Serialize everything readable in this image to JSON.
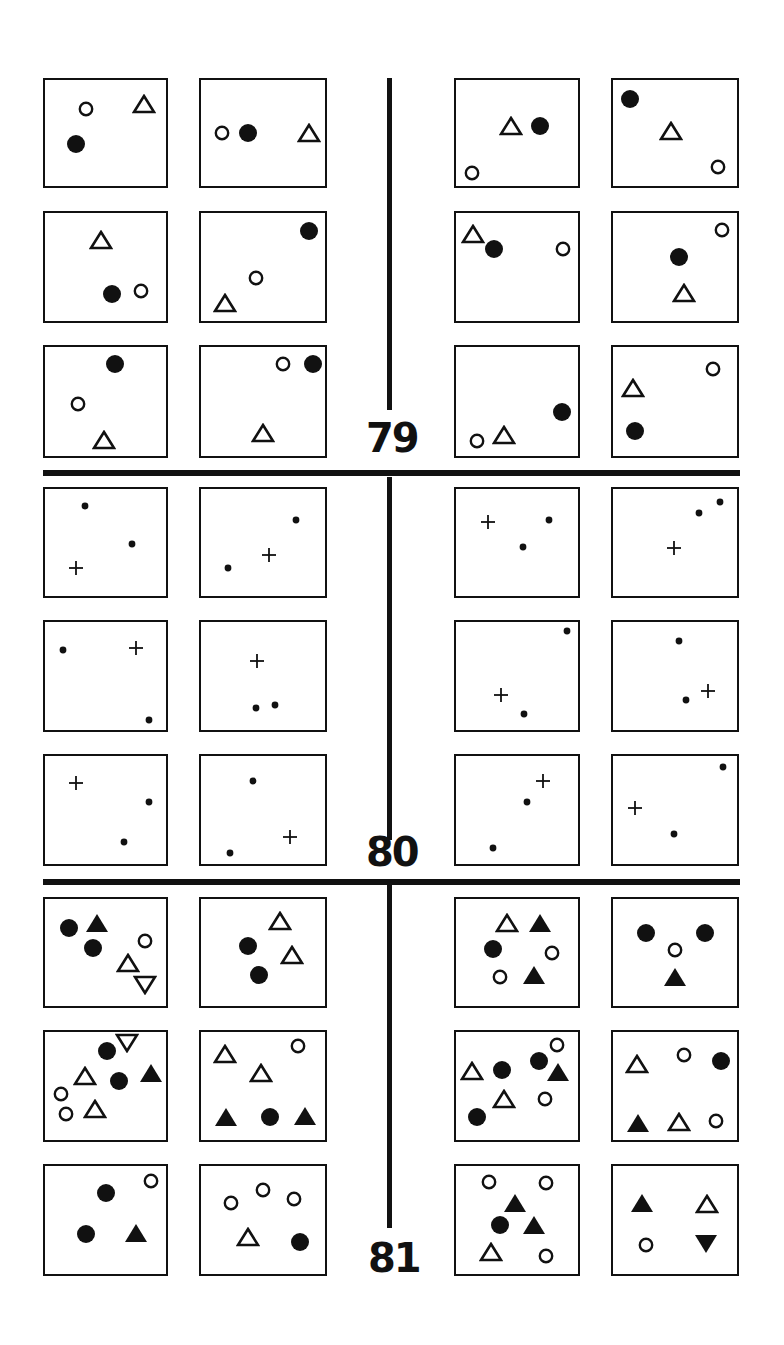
{
  "problems": [
    {
      "number": "79",
      "boxes": [
        {
          "shapes": [
            [
              "oc",
              34,
              27
            ],
            [
              "ot",
              82,
              23
            ],
            [
              "fc",
              26,
              60
            ]
          ]
        },
        {
          "shapes": [
            [
              "oc",
              17,
              50
            ],
            [
              "fc",
              38,
              50
            ],
            [
              "ot",
              87,
              50
            ]
          ]
        },
        {
          "shapes": [
            [
              "ot",
              45,
              43
            ],
            [
              "fc",
              69,
              43
            ],
            [
              "oc",
              13,
              88
            ]
          ]
        },
        {
          "shapes": [
            [
              "fc",
              14,
              18
            ],
            [
              "ot",
              47,
              48
            ],
            [
              "oc",
              85,
              82
            ]
          ]
        },
        {
          "shapes": [
            [
              "ot",
              46,
              25
            ],
            [
              "fc",
              55,
              75
            ],
            [
              "oc",
              79,
              72
            ]
          ]
        },
        {
          "shapes": [
            [
              "fc",
              87,
              17
            ],
            [
              "oc",
              44,
              60
            ],
            [
              "ot",
              19,
              83
            ]
          ]
        },
        {
          "shapes": [
            [
              "ot",
              14,
              19
            ],
            [
              "fc",
              31,
              33
            ],
            [
              "oc",
              88,
              33
            ]
          ]
        },
        {
          "shapes": [
            [
              "oc",
              88,
              16
            ],
            [
              "fc",
              53,
              41
            ],
            [
              "ot",
              57,
              74
            ]
          ]
        },
        {
          "shapes": [
            [
              "fc",
              58,
              16
            ],
            [
              "oc",
              27,
              52
            ],
            [
              "ot",
              49,
              85
            ]
          ]
        },
        {
          "shapes": [
            [
              "oc",
              66,
              16
            ],
            [
              "fc",
              90,
              16
            ],
            [
              "ot",
              50,
              79
            ]
          ]
        },
        {
          "shapes": [
            [
              "fc",
              87,
              60
            ],
            [
              "ot",
              39,
              81
            ],
            [
              "oc",
              17,
              86
            ]
          ]
        },
        {
          "shapes": [
            [
              "oc",
              81,
              20
            ],
            [
              "ot",
              16,
              38
            ],
            [
              "fc",
              18,
              77
            ]
          ]
        }
      ],
      "section_layout": "79"
    },
    {
      "number": "80",
      "boxes": [
        {
          "shapes": [
            [
              "d",
              33,
              16
            ],
            [
              "d",
              72,
              51
            ],
            [
              "p",
              26,
              74
            ]
          ]
        },
        {
          "shapes": [
            [
              "d",
              77,
              29
            ],
            [
              "p",
              55,
              62
            ],
            [
              "d",
              22,
              74
            ]
          ]
        },
        {
          "shapes": [
            [
              "p",
              26,
              31
            ],
            [
              "d",
              55,
              54
            ],
            [
              "d",
              76,
              29
            ]
          ]
        },
        {
          "shapes": [
            [
              "d",
              86,
              12
            ],
            [
              "d",
              69,
              22
            ],
            [
              "p",
              49,
              55
            ]
          ]
        },
        {
          "shapes": [
            [
              "d",
              15,
              26
            ],
            [
              "p",
              75,
              24
            ],
            [
              "d",
              86,
              91
            ]
          ]
        },
        {
          "shapes": [
            [
              "p",
              45,
              36
            ],
            [
              "d",
              44,
              80
            ],
            [
              "d",
              60,
              77
            ]
          ]
        },
        {
          "shapes": [
            [
              "d",
              91,
              8
            ],
            [
              "p",
              37,
              68
            ],
            [
              "d",
              56,
              85
            ]
          ]
        },
        {
          "shapes": [
            [
              "d",
              53,
              18
            ],
            [
              "d",
              59,
              72
            ],
            [
              "p",
              77,
              64
            ]
          ]
        },
        {
          "shapes": [
            [
              "p",
              26,
              25
            ],
            [
              "d",
              86,
              43
            ],
            [
              "d",
              65,
              80
            ]
          ]
        },
        {
          "shapes": [
            [
              "d",
              42,
              23
            ],
            [
              "p",
              72,
              75
            ],
            [
              "d",
              23,
              90
            ]
          ]
        },
        {
          "shapes": [
            [
              "p",
              71,
              23
            ],
            [
              "d",
              58,
              43
            ],
            [
              "d",
              30,
              85
            ]
          ]
        },
        {
          "shapes": [
            [
              "d",
              89,
              10
            ],
            [
              "p",
              18,
              48
            ],
            [
              "d",
              49,
              72
            ]
          ]
        }
      ]
    },
    {
      "number": "81",
      "boxes": [
        {
          "shapes": [
            [
              "fc",
              20,
              27
            ],
            [
              "ft",
              43,
              22
            ],
            [
              "fc",
              40,
              46
            ],
            [
              "oc",
              83,
              39
            ],
            [
              "ot",
              69,
              60
            ],
            [
              "oti",
              83,
              80
            ]
          ]
        },
        {
          "shapes": [
            [
              "ot",
              64,
              21
            ],
            [
              "fc",
              38,
              44
            ],
            [
              "ot",
              73,
              52
            ],
            [
              "fc",
              47,
              71
            ]
          ]
        },
        {
          "shapes": [
            [
              "ot",
              42,
              22
            ],
            [
              "ft",
              69,
              22
            ],
            [
              "fc",
              30,
              47
            ],
            [
              "oc",
              79,
              50
            ],
            [
              "oc",
              36,
              73
            ],
            [
              "ft",
              64,
              71
            ]
          ]
        },
        {
          "shapes": [
            [
              "fc",
              27,
              32
            ],
            [
              "fc",
              74,
              32
            ],
            [
              "oc",
              50,
              48
            ],
            [
              "ft",
              50,
              73
            ]
          ]
        },
        {
          "shapes": [
            [
              "fc",
              51,
              18
            ],
            [
              "oti",
              68,
              10
            ],
            [
              "ft",
              88,
              38
            ],
            [
              "ot",
              33,
              41
            ],
            [
              "fc",
              61,
              45
            ],
            [
              "oc",
              13,
              57
            ],
            [
              "ot",
              41,
              71
            ],
            [
              "oc",
              17,
              76
            ]
          ]
        },
        {
          "shapes": [
            [
              "ot",
              19,
              20
            ],
            [
              "oc",
              78,
              13
            ],
            [
              "ot",
              48,
              38
            ],
            [
              "ft",
              20,
              79
            ],
            [
              "fc",
              56,
              79
            ],
            [
              "ft",
              84,
              78
            ]
          ]
        },
        {
          "shapes": [
            [
              "ot",
              13,
              36
            ],
            [
              "fc",
              38,
              35
            ],
            [
              "fc",
              68,
              27
            ],
            [
              "oc",
              83,
              12
            ],
            [
              "ft",
              84,
              37
            ],
            [
              "ot",
              39,
              62
            ],
            [
              "oc",
              73,
              62
            ],
            [
              "fc",
              17,
              79
            ]
          ]
        },
        {
          "shapes": [
            [
              "ot",
              19,
              30
            ],
            [
              "oc",
              57,
              21
            ],
            [
              "fc",
              87,
              27
            ],
            [
              "ft",
              20,
              84
            ],
            [
              "ot",
              53,
              83
            ],
            [
              "oc",
              83,
              82
            ]
          ]
        },
        {
          "shapes": [
            [
              "fc",
              50,
              25
            ],
            [
              "oc",
              88,
              14
            ],
            [
              "fc",
              34,
              63
            ],
            [
              "ft",
              75,
              62
            ]
          ]
        },
        {
          "shapes": [
            [
              "oc",
              24,
              34
            ],
            [
              "oc",
              50,
              22
            ],
            [
              "oc",
              75,
              31
            ],
            [
              "ot",
              38,
              66
            ],
            [
              "fc",
              80,
              70
            ]
          ]
        },
        {
          "shapes": [
            [
              "oc",
              27,
              15
            ],
            [
              "oc",
              74,
              16
            ],
            [
              "ft",
              48,
              34
            ],
            [
              "fc",
              36,
              55
            ],
            [
              "ft",
              64,
              55
            ],
            [
              "ot",
              29,
              80
            ],
            [
              "oc",
              74,
              83
            ]
          ]
        },
        {
          "shapes": [
            [
              "ft",
              23,
              34
            ],
            [
              "ot",
              76,
              35
            ],
            [
              "oc",
              27,
              73
            ],
            [
              "fti",
              75,
              72
            ]
          ]
        }
      ]
    }
  ],
  "shape_legend": {
    "oc": "open-circle",
    "fc": "filled-circle",
    "ot": "open-triangle",
    "ft": "filled-triangle",
    "oti": "open-inverted-triangle",
    "fti": "filled-inverted-triangle",
    "d": "dot",
    "p": "plus"
  },
  "colors": {
    "ink": "#111111",
    "paper": "#ffffff"
  }
}
